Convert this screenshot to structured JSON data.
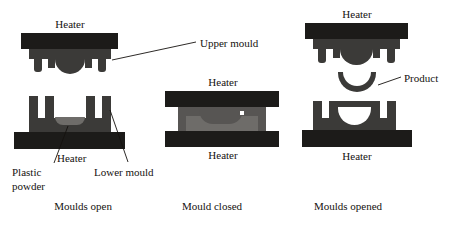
{
  "diagram": {
    "colors": {
      "heater": "#1c1b19",
      "mould_body": "#3b3a38",
      "mould_interior": "#575553",
      "cavity_light": "#6e6c69",
      "product": "#3b3a38",
      "cavity_white": "#ffffff",
      "text": "#15120f",
      "background": "#ffffff"
    },
    "panels": [
      {
        "id": "panel-moulds-open",
        "caption": "Moulds open",
        "labels": {
          "top_heater": "Heater",
          "bottom_heater": "Heater",
          "plastic_powder_line1": "Plastic",
          "plastic_powder_line2": "powder",
          "lower_mould": "Lower mould",
          "upper_mould": "Upper mould"
        }
      },
      {
        "id": "panel-mould-closed",
        "caption": "Mould closed",
        "labels": {
          "top_heater": "Heater",
          "bottom_heater": "Heater"
        }
      },
      {
        "id": "panel-moulds-opened",
        "caption": "Moulds opened",
        "labels": {
          "top_heater": "Heater",
          "bottom_heater": "Heater",
          "product": "Product"
        }
      }
    ]
  }
}
